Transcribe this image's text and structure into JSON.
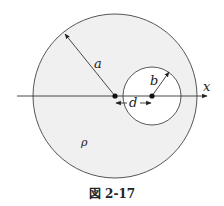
{
  "figure": {
    "caption": "図 2-17",
    "colors": {
      "outer_fill": "#f0f0f0",
      "inner_fill": "#ffffff",
      "stroke": "#333333",
      "background": "#ffffff"
    },
    "outer_circle": {
      "cx": 115,
      "cy": 96,
      "r": 82
    },
    "inner_circle": {
      "cx": 152,
      "cy": 96,
      "r": 29
    },
    "axis": {
      "label": "x",
      "x1": 17,
      "x2": 207,
      "y": 96
    },
    "labels": {
      "outer_radius": "a",
      "inner_radius": "b",
      "offset": "d",
      "charge_density": "ρ"
    }
  }
}
